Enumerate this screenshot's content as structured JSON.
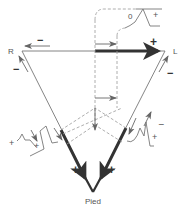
{
  "diagram": {
    "title": "",
    "nodes": {
      "R": {
        "label": "R",
        "x": 14,
        "y": 50
      },
      "L": {
        "label": "L",
        "x": 172,
        "y": 50
      },
      "Pied": {
        "label": "Pied",
        "x": 94,
        "y": 188
      }
    },
    "signs": {
      "top_minus": "−",
      "top_plus": "+",
      "left_minus": "−",
      "right_minus": "−",
      "bottom_left_plus": "+",
      "bottom_right_plus": "+",
      "wave_left_plus_a": "+",
      "wave_left_plus_b": "+",
      "wave_right_plus": "+",
      "wave_right_minus": "−",
      "top_wave_zero": "0",
      "top_wave_plus": "+"
    },
    "edges": [
      {
        "from": "R",
        "to": "L",
        "style": "thin+thick",
        "direction": "to L"
      },
      {
        "from": "R",
        "to": "Pied",
        "style": "thin+thick",
        "direction": "to Pied"
      },
      {
        "from": "L",
        "to": "Pied",
        "style": "thin+thick",
        "direction": "to Pied"
      }
    ],
    "colors": {
      "line": "#555555",
      "thick": "#333333",
      "dashed": "#888888",
      "text": "#555555"
    }
  }
}
